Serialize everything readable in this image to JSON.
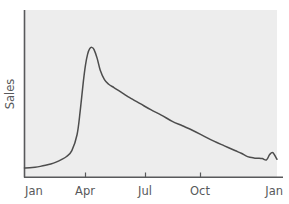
{
  "chart_data": {
    "type": "line",
    "title": "",
    "subtitle": "",
    "xlabel": "",
    "ylabel": "Sales",
    "grid": false,
    "legend": null,
    "legend_position": "none",
    "xlim": [
      0,
      12
    ],
    "ylim": [
      0,
      100
    ],
    "x_tick_labels": [
      "Jan",
      "Apr",
      "Jul",
      "Oct",
      "Jan"
    ],
    "x_tick_values": [
      0,
      3,
      6,
      9,
      12
    ],
    "y_tick_labels": [],
    "annotations": [],
    "series": [
      {
        "name": "Sales",
        "color": "#4d4d4d",
        "x": [
          0.0,
          0.25,
          0.5,
          0.75,
          1.0,
          1.25,
          1.5,
          1.75,
          2.0,
          2.25,
          2.5,
          2.65,
          2.8,
          2.9,
          3.0,
          3.1,
          3.2,
          3.3,
          3.45,
          3.6,
          3.8,
          4.0,
          4.25,
          4.5,
          4.75,
          5.0,
          5.5,
          6.0,
          6.5,
          7.0,
          7.5,
          8.0,
          8.5,
          9.0,
          9.5,
          10.0,
          10.3,
          10.6,
          10.9,
          11.1,
          11.3,
          11.5,
          11.65,
          11.8,
          12.0
        ],
        "y": [
          3.0,
          3.2,
          3.6,
          4.2,
          5.0,
          6.0,
          7.4,
          9.2,
          11.6,
          16.0,
          28.0,
          46.0,
          68.0,
          80.0,
          88.0,
          92.0,
          93.0,
          91.5,
          85.0,
          76.0,
          69.0,
          65.5,
          63.0,
          60.5,
          58.0,
          55.5,
          51.0,
          46.5,
          42.5,
          38.0,
          34.5,
          31.0,
          27.0,
          23.0,
          19.5,
          16.0,
          14.0,
          11.5,
          10.5,
          10.3,
          10.0,
          9.0,
          13.0,
          14.5,
          9.5
        ]
      }
    ]
  },
  "axes": {
    "y_title": "Sales",
    "x_ticks": [
      {
        "label": "Jan"
      },
      {
        "label": "Apr"
      },
      {
        "label": "Jul"
      },
      {
        "label": "Oct"
      },
      {
        "label": "Jan"
      }
    ]
  },
  "colors": {
    "plot_background": "#ededed",
    "page_background": "#ffffff",
    "axis_line": "#58595b",
    "line_color": "#4d4d4d",
    "label_text": "#58595b"
  }
}
